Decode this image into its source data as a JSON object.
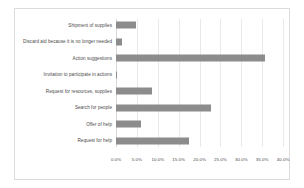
{
  "chart_data": {
    "type": "bar",
    "orientation": "horizontal",
    "title": "",
    "xlabel": "",
    "ylabel": "",
    "xlim": [
      0,
      40
    ],
    "grid": true,
    "legend": false,
    "bar_color": "#8c8c8c",
    "tick_labels": [
      "0.0%",
      "5.0%",
      "10.0%",
      "15.0%",
      "20.0%",
      "25.0%",
      "30.0%",
      "35.0%",
      "40.0%"
    ],
    "tick_values": [
      0,
      5,
      10,
      15,
      20,
      25,
      30,
      35,
      40
    ],
    "categories": [
      "Shipment of supplies",
      "Discard aid because it is no longer needed",
      "Action suggestions",
      "Invitation to participate in actions",
      "Request for resources, supplies",
      "Search for people",
      "Offer of help",
      "Request for help"
    ],
    "values": [
      4.8,
      1.4,
      35.8,
      0.3,
      8.6,
      22.8,
      5.9,
      17.6
    ]
  }
}
